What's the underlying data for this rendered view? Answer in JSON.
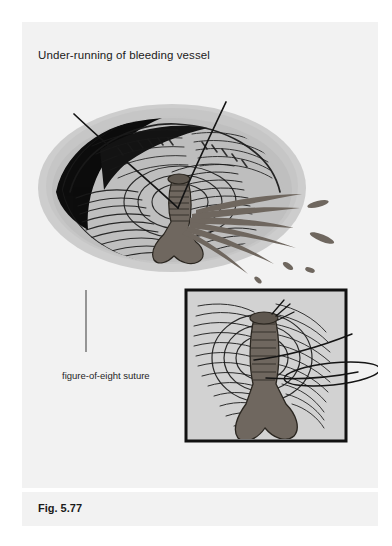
{
  "page": {
    "background_color": "#f2f2f2",
    "margin_color": "#ffffff"
  },
  "header": {
    "title": "Under-running of bleeding vessel"
  },
  "figure": {
    "caption": "Fig. 5.77",
    "annotations": [
      {
        "label": "figure-of-eight suture"
      }
    ],
    "colors": {
      "halo": "#c9c9c9",
      "wound_fill": "#bdbdbd",
      "inset_fill": "#d2d2d2",
      "vessel": "#6f675f",
      "blood": "#6f675f",
      "ink": "#141414",
      "cavity_shadow": "#101010"
    }
  },
  "inset": {
    "border_color": "#111111",
    "border_width_px": 3,
    "x": 164,
    "y": 268,
    "width": 160,
    "height": 151
  }
}
